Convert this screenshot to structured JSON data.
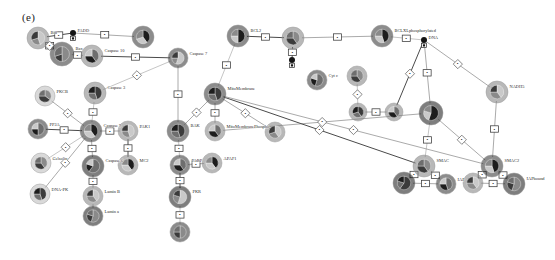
{
  "figure": {
    "panel_label": "(e)",
    "width": 555,
    "height": 260,
    "background": "#ffffff",
    "type": "network-graph"
  },
  "palette": {
    "node_light": "#b9b9b9",
    "node_mid": "#7d7d7d",
    "node_dark": "#2e2e2e",
    "node_black": "#141414",
    "edge": "#8d8d8d",
    "edge_dark": "#4a4a4a",
    "edge_pale": "#b2b2b2",
    "marker_fill": "#ffffff",
    "marker_stroke": "#3a3a3a",
    "text": "#2a2a2a"
  },
  "chart_data": {
    "type": "scatter",
    "title": "(e)",
    "xlabel": "",
    "ylabel": "",
    "nodes": [
      {
        "id": "n1",
        "label": "Bid",
        "x": 38,
        "y": 38,
        "r": 11,
        "tone": "mid",
        "slices": [
          45,
          25,
          30
        ]
      },
      {
        "id": "n2",
        "label": "Bax",
        "x": 62,
        "y": 54,
        "r": 12,
        "tone": "dark",
        "slices": [
          50,
          20,
          30
        ]
      },
      {
        "id": "n3",
        "label": "FADD",
        "x": 73,
        "y": 33,
        "r": 3,
        "tone": "black",
        "slices": [
          100
        ]
      },
      {
        "id": "n4",
        "label": "Caspase 10",
        "x": 92,
        "y": 56,
        "r": 11,
        "tone": "mid",
        "slices": [
          40,
          35,
          25
        ]
      },
      {
        "id": "n5",
        "label": "",
        "x": 143,
        "y": 37,
        "r": 11,
        "tone": "dark",
        "slices": [
          40,
          30,
          30
        ]
      },
      {
        "id": "n6",
        "label": "Caspase 7",
        "x": 178,
        "y": 58,
        "r": 10,
        "tone": "dark",
        "slices": [
          55,
          20,
          25
        ]
      },
      {
        "id": "n7",
        "label": "PKCB",
        "x": 45,
        "y": 96,
        "r": 10,
        "tone": "light",
        "slices": [
          35,
          40,
          25
        ]
      },
      {
        "id": "n8",
        "label": "Caspase 3",
        "x": 95,
        "y": 93,
        "r": 11,
        "tone": "mid",
        "slices": [
          45,
          30,
          25
        ]
      },
      {
        "id": "n9",
        "label": "PP2A",
        "x": 38,
        "y": 129,
        "r": 10,
        "tone": "dark",
        "slices": [
          50,
          25,
          25
        ]
      },
      {
        "id": "n10",
        "label": "Caspase 9",
        "x": 91,
        "y": 131,
        "r": 11,
        "tone": "dark",
        "slices": [
          40,
          35,
          25
        ]
      },
      {
        "id": "n11",
        "label": "PAK1",
        "x": 128,
        "y": 131,
        "r": 10,
        "tone": "mid",
        "slices": [
          45,
          30,
          25
        ]
      },
      {
        "id": "n12",
        "label": "Gelsolin",
        "x": 41,
        "y": 163,
        "r": 10,
        "tone": "light",
        "slices": [
          40,
          35,
          25
        ]
      },
      {
        "id": "n13",
        "label": "DNA-PK",
        "x": 40,
        "y": 194,
        "r": 10,
        "tone": "light",
        "slices": [
          45,
          30,
          25
        ]
      },
      {
        "id": "n14",
        "label": "Caspase 6",
        "x": 93,
        "y": 166,
        "r": 11,
        "tone": "black",
        "slices": [
          60,
          20,
          20
        ]
      },
      {
        "id": "n15",
        "label": "MC2",
        "x": 128,
        "y": 165,
        "r": 10,
        "tone": "mid",
        "slices": [
          40,
          35,
          25
        ]
      },
      {
        "id": "n16",
        "label": "Lamin B",
        "x": 93,
        "y": 196,
        "r": 10,
        "tone": "mid",
        "slices": [
          40,
          35,
          25
        ]
      },
      {
        "id": "n17",
        "label": "Lamin a",
        "x": 93,
        "y": 216,
        "r": 10,
        "tone": "black",
        "slices": [
          55,
          25,
          20
        ]
      },
      {
        "id": "n18",
        "label": "BAK",
        "x": 178,
        "y": 131,
        "r": 11,
        "tone": "dark",
        "slices": [
          45,
          30,
          25
        ]
      },
      {
        "id": "n19",
        "label": "PARP",
        "x": 180,
        "y": 165,
        "r": 10,
        "tone": "dark",
        "slices": [
          40,
          35,
          25
        ]
      },
      {
        "id": "n20",
        "label": "APAF1",
        "x": 212,
        "y": 163,
        "r": 10,
        "tone": "mid",
        "slices": [
          40,
          35,
          25
        ]
      },
      {
        "id": "n21",
        "label": "PKR",
        "x": 180,
        "y": 197,
        "r": 11,
        "tone": "black",
        "slices": [
          55,
          25,
          20
        ]
      },
      {
        "id": "n22",
        "label": "",
        "x": 180,
        "y": 232,
        "r": 10,
        "tone": "dark",
        "slices": [
          50,
          25,
          25
        ]
      },
      {
        "id": "n23",
        "label": "MitoMembrane",
        "x": 215,
        "y": 94,
        "r": 11,
        "tone": "dark",
        "slices": [
          45,
          30,
          25
        ]
      },
      {
        "id": "n24",
        "label": "MitoMembranePhospho",
        "x": 215,
        "y": 131,
        "r": 10,
        "tone": "mid",
        "slices": [
          40,
          35,
          25
        ]
      },
      {
        "id": "n25",
        "label": "BCL2",
        "x": 238,
        "y": 36,
        "r": 11,
        "tone": "dark",
        "slices": [
          50,
          25,
          25
        ]
      },
      {
        "id": "n26",
        "label": "",
        "x": 275,
        "y": 132,
        "r": 10,
        "tone": "mid",
        "slices": [
          40,
          30,
          30
        ]
      },
      {
        "id": "n27",
        "label": "",
        "x": 293,
        "y": 38,
        "r": 11,
        "tone": "mid",
        "slices": [
          40,
          35,
          25
        ]
      },
      {
        "id": "n28",
        "label": "",
        "x": 292,
        "y": 60,
        "r": 3,
        "tone": "black",
        "slices": [
          100
        ]
      },
      {
        "id": "n29",
        "label": "Cyt c",
        "x": 317,
        "y": 80,
        "r": 10,
        "tone": "dark",
        "slices": [
          55,
          25,
          20
        ]
      },
      {
        "id": "n30",
        "label": "BCLXLphosphorylated",
        "x": 382,
        "y": 36,
        "r": 11,
        "tone": "dark",
        "slices": [
          45,
          30,
          25
        ]
      },
      {
        "id": "n31",
        "label": "DNA",
        "x": 424,
        "y": 40,
        "r": 3,
        "tone": "black",
        "slices": [
          100
        ]
      },
      {
        "id": "n32",
        "label": "",
        "x": 357,
        "y": 76,
        "r": 10,
        "tone": "mid",
        "slices": [
          40,
          35,
          25
        ]
      },
      {
        "id": "n33",
        "label": "",
        "x": 358,
        "y": 112,
        "r": 9,
        "tone": "mid",
        "slices": [
          40,
          30,
          30
        ]
      },
      {
        "id": "n34",
        "label": "",
        "x": 394,
        "y": 112,
        "r": 9,
        "tone": "mid",
        "slices": [
          40,
          35,
          25
        ]
      },
      {
        "id": "n35",
        "label": "",
        "x": 431,
        "y": 113,
        "r": 12,
        "tone": "black",
        "slices": [
          55,
          25,
          20
        ]
      },
      {
        "id": "n36",
        "label": "NADH5",
        "x": 497,
        "y": 92,
        "r": 11,
        "tone": "mid",
        "slices": [
          40,
          35,
          25
        ]
      },
      {
        "id": "n37",
        "label": "SMAC",
        "x": 424,
        "y": 166,
        "r": 11,
        "tone": "mid",
        "slices": [
          40,
          35,
          25
        ]
      },
      {
        "id": "n38",
        "label": "",
        "x": 404,
        "y": 183,
        "r": 11,
        "tone": "black",
        "slices": [
          60,
          20,
          20
        ]
      },
      {
        "id": "n39",
        "label": "IAP",
        "x": 446,
        "y": 184,
        "r": 10,
        "tone": "dark",
        "slices": [
          45,
          30,
          25
        ]
      },
      {
        "id": "n40",
        "label": "SMAC2",
        "x": 492,
        "y": 166,
        "r": 11,
        "tone": "dark",
        "slices": [
          45,
          30,
          25
        ]
      },
      {
        "id": "n41",
        "label": "",
        "x": 473,
        "y": 183,
        "r": 10,
        "tone": "mid",
        "slices": [
          40,
          35,
          25
        ]
      },
      {
        "id": "n42",
        "label": "IAPbound",
        "x": 514,
        "y": 184,
        "r": 11,
        "tone": "black",
        "slices": [
          55,
          25,
          20
        ]
      }
    ],
    "edges": [
      {
        "from": "n1",
        "to": "n3",
        "marker": "box"
      },
      {
        "from": "n1",
        "to": "n2",
        "marker": "box"
      },
      {
        "from": "n2",
        "to": "n4",
        "marker": "box"
      },
      {
        "from": "n1",
        "to": "n2",
        "marker": "diamond"
      },
      {
        "from": "n3",
        "to": "n5",
        "marker": "box"
      },
      {
        "from": "n4",
        "to": "n6",
        "marker": "box"
      },
      {
        "from": "n6",
        "to": "n8",
        "marker": "diamond"
      },
      {
        "from": "n6",
        "to": "n18",
        "marker": "box"
      },
      {
        "from": "n7",
        "to": "n10",
        "marker": "diamond"
      },
      {
        "from": "n8",
        "to": "n10",
        "marker": "box"
      },
      {
        "from": "n9",
        "to": "n10",
        "marker": "box"
      },
      {
        "from": "n10",
        "to": "n11",
        "marker": "box"
      },
      {
        "from": "n10",
        "to": "n12",
        "marker": "diamond"
      },
      {
        "from": "n10",
        "to": "n13",
        "marker": "diamond"
      },
      {
        "from": "n10",
        "to": "n14",
        "marker": "box"
      },
      {
        "from": "n11",
        "to": "n15",
        "marker": "box"
      },
      {
        "from": "n14",
        "to": "n16",
        "marker": "box"
      },
      {
        "from": "n16",
        "to": "n17",
        "marker": "none"
      },
      {
        "from": "n18",
        "to": "n19",
        "marker": "box"
      },
      {
        "from": "n19",
        "to": "n20",
        "marker": "box"
      },
      {
        "from": "n19",
        "to": "n21",
        "marker": "box"
      },
      {
        "from": "n21",
        "to": "n22",
        "marker": "box"
      },
      {
        "from": "n23",
        "to": "n18",
        "marker": "diamond"
      },
      {
        "from": "n23",
        "to": "n24",
        "marker": "box"
      },
      {
        "from": "n23",
        "to": "n25",
        "marker": "box"
      },
      {
        "from": "n25",
        "to": "n27",
        "marker": "box"
      },
      {
        "from": "n27",
        "to": "n30",
        "marker": "box"
      },
      {
        "from": "n30",
        "to": "n31",
        "marker": "box"
      },
      {
        "from": "n23",
        "to": "n26",
        "marker": "diamond"
      },
      {
        "from": "n24",
        "to": "n35",
        "marker": "diamond"
      },
      {
        "from": "n27",
        "to": "n28",
        "marker": "box"
      },
      {
        "from": "n31",
        "to": "n35",
        "marker": "box"
      },
      {
        "from": "n31",
        "to": "n36",
        "marker": "diamond"
      },
      {
        "from": "n32",
        "to": "n33",
        "marker": "diamond"
      },
      {
        "from": "n33",
        "to": "n34",
        "marker": "box"
      },
      {
        "from": "n34",
        "to": "n31",
        "marker": "diamond"
      },
      {
        "from": "n35",
        "to": "n37",
        "marker": "box"
      },
      {
        "from": "n35",
        "to": "n40",
        "marker": "diamond"
      },
      {
        "from": "n36",
        "to": "n40",
        "marker": "box"
      },
      {
        "from": "n37",
        "to": "n38",
        "marker": "box"
      },
      {
        "from": "n37",
        "to": "n39",
        "marker": "box"
      },
      {
        "from": "n38",
        "to": "n39",
        "marker": "box"
      },
      {
        "from": "n40",
        "to": "n41",
        "marker": "box"
      },
      {
        "from": "n40",
        "to": "n42",
        "marker": "box"
      },
      {
        "from": "n41",
        "to": "n42",
        "marker": "box"
      },
      {
        "from": "n23",
        "to": "n37",
        "marker": "diamond"
      },
      {
        "from": "n23",
        "to": "n40",
        "marker": "diamond"
      }
    ]
  }
}
